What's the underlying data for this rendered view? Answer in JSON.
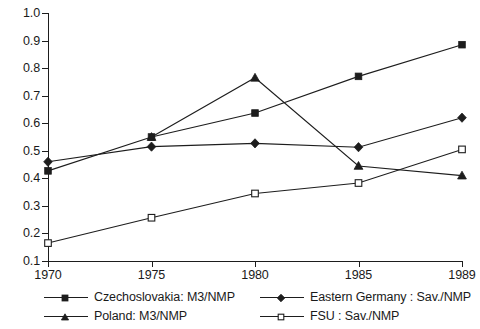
{
  "chart_data": {
    "type": "line",
    "title": "",
    "xlabel": "",
    "ylabel": "",
    "x": [
      1970,
      1975,
      1980,
      1985,
      1989
    ],
    "xtick_labels": [
      "1970",
      "1975",
      "1980",
      "1985",
      "1989"
    ],
    "ytick_labels": [
      "0.1",
      "0.2",
      "0.3",
      "0.4",
      "0.5",
      "0.6",
      "0.7",
      "0.8",
      "0.9",
      "1.0"
    ],
    "ytick_values": [
      0.1,
      0.2,
      0.3,
      0.4,
      0.5,
      0.6,
      0.7,
      0.8,
      0.9,
      1.0
    ],
    "ylim": [
      0.1,
      1.0
    ],
    "xlim": [
      1970,
      1989
    ],
    "grid": false,
    "legend_position": "bottom",
    "series": [
      {
        "name": "Czechoslovakia: M3/NMP",
        "marker": "filled-square",
        "x": [
          1970,
          1975,
          1980,
          1985,
          1989
        ],
        "values": [
          0.427,
          0.55,
          0.637,
          0.77,
          0.885
        ]
      },
      {
        "name": "Eastern Germany : Sav./NMP",
        "marker": "filled-diamond",
        "x": [
          1970,
          1975,
          1980,
          1985,
          1989
        ],
        "values": [
          0.46,
          0.515,
          0.527,
          0.513,
          0.62
        ]
      },
      {
        "name": "Poland: M3/NMP",
        "marker": "filled-triangle",
        "x": [
          1975,
          1980,
          1985,
          1989
        ],
        "values": [
          0.55,
          0.765,
          0.445,
          0.41
        ]
      },
      {
        "name": "FSU : Sav./NMP",
        "marker": "open-square",
        "x": [
          1970,
          1975,
          1980,
          1985,
          1989
        ],
        "values": [
          0.165,
          0.257,
          0.345,
          0.383,
          0.505
        ]
      }
    ],
    "colors": {
      "line": "#1d1d1d",
      "marker_fill": "#1d1d1d",
      "marker_open_fill": "#ffffff",
      "axis": "#1d1d1d",
      "background": "#ffffff"
    }
  },
  "axis": {
    "y_labels": [
      "1.0",
      "0.9",
      "0.8",
      "0.7",
      "0.6",
      "0.5",
      "0.4",
      "0.3",
      "0.2",
      "0.1"
    ],
    "x_labels": [
      "1970",
      "1975",
      "1980",
      "1985",
      "1989"
    ]
  },
  "legend": {
    "entries": [
      {
        "label": "Czechoslovakia: M3/NMP",
        "marker": "filled-square"
      },
      {
        "label": "Eastern Germany : Sav./NMP",
        "marker": "filled-diamond"
      },
      {
        "label": "Poland: M3/NMP",
        "marker": "filled-triangle"
      },
      {
        "label": "FSU : Sav./NMP",
        "marker": "open-square"
      }
    ]
  }
}
